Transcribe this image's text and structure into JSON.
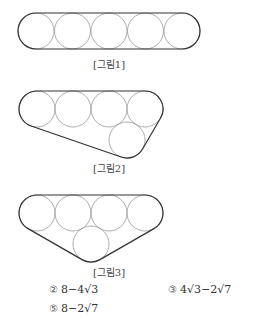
{
  "figures": [
    {
      "caption": "[그림1]",
      "circle_count": 5,
      "arrangement": "5 circles in a row"
    },
    {
      "caption": "[그림2]",
      "circle_count": 5,
      "arrangement": "4 circles in a row, 1 below between 3rd and 4th"
    },
    {
      "caption": "[그림3]",
      "circle_count": 5,
      "arrangement": "4 circles in a row, 1 below between 2nd and 3rd"
    }
  ],
  "choices": [
    {
      "number": "②",
      "expr": "8−4√3"
    },
    {
      "number": "③",
      "expr": "4√3−2√7"
    },
    {
      "number": "⑤",
      "expr": "8−2√7"
    }
  ],
  "colors": {
    "belt": "#333333",
    "circle": "#9a9a9a"
  }
}
